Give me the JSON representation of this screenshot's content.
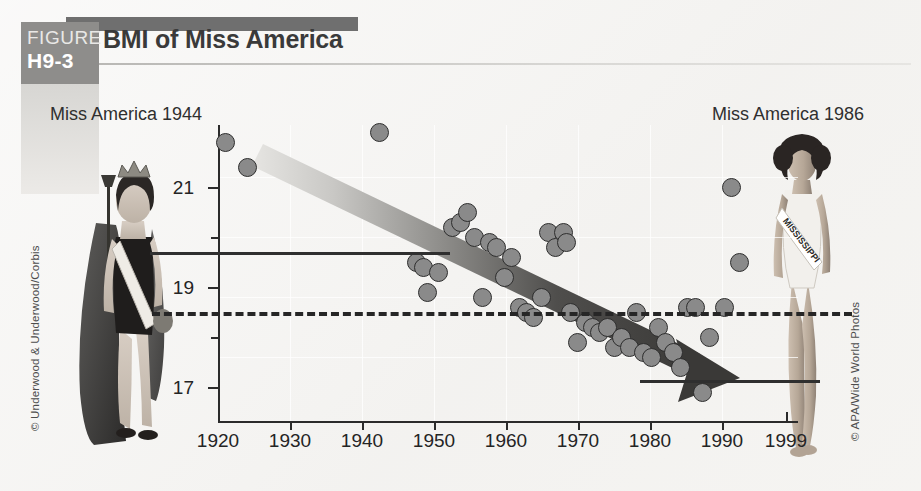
{
  "figure": {
    "badge_word": "FIGURE",
    "badge_number": "H9-3",
    "title": "BMI of Miss America"
  },
  "credits": {
    "left": "© Underwood & Underwood/Corbis",
    "right": "© APA/Wide World Photos"
  },
  "photos": {
    "left_caption": "Miss America 1944",
    "right_caption": "Miss America 1986",
    "right_sash_text": "MISSISSIPPI"
  },
  "colors": {
    "badge_gray": "#8e8d8b",
    "header_bar_gray": "#6f6f6f",
    "dot_fill": "#8a8a8a",
    "dot_stroke": "#2e2e2e",
    "axis": "#2b2b2b",
    "arrow_dark": "#3a3a3a",
    "page_bg": "#f4f3f1"
  },
  "chart_data": {
    "type": "scatter",
    "title": "BMI of Miss America",
    "xlabel": "",
    "ylabel": "",
    "xlim": [
      1920,
      1999
    ],
    "ylim": [
      16.2,
      22.2
    ],
    "grid": true,
    "legend": "none",
    "x_ticks": [
      1920,
      1930,
      1940,
      1950,
      1960,
      1970,
      1980,
      1990,
      1999
    ],
    "x_tick_labels": [
      "1920",
      "1930",
      "1940",
      "1950",
      "1960",
      "1970",
      "1980",
      "1990",
      "1999"
    ],
    "y_ticks_major": [
      17,
      19,
      21
    ],
    "y_tick_labels": [
      "17",
      "19",
      "21"
    ],
    "y_ticks_minor": [
      18,
      20
    ],
    "points": [
      {
        "year": 1921,
        "bmi": 21.9
      },
      {
        "year": 1924,
        "bmi": 21.4
      },
      {
        "year": 1942,
        "bmi": 22.1
      },
      {
        "year": 1947,
        "bmi": 19.5
      },
      {
        "year": 1948,
        "bmi": 19.4
      },
      {
        "year": 1948.5,
        "bmi": 18.9
      },
      {
        "year": 1950,
        "bmi": 19.3
      },
      {
        "year": 1952,
        "bmi": 20.2
      },
      {
        "year": 1953,
        "bmi": 20.3
      },
      {
        "year": 1954,
        "bmi": 20.5
      },
      {
        "year": 1955,
        "bmi": 20.0
      },
      {
        "year": 1956,
        "bmi": 18.8
      },
      {
        "year": 1957,
        "bmi": 19.9
      },
      {
        "year": 1958,
        "bmi": 19.8
      },
      {
        "year": 1959,
        "bmi": 19.2
      },
      {
        "year": 1960,
        "bmi": 19.6
      },
      {
        "year": 1961,
        "bmi": 18.6
      },
      {
        "year": 1962,
        "bmi": 18.5
      },
      {
        "year": 1963,
        "bmi": 18.4
      },
      {
        "year": 1964,
        "bmi": 18.8
      },
      {
        "year": 1965,
        "bmi": 20.1
      },
      {
        "year": 1966,
        "bmi": 19.8
      },
      {
        "year": 1967,
        "bmi": 20.1
      },
      {
        "year": 1967.5,
        "bmi": 19.9
      },
      {
        "year": 1968,
        "bmi": 18.5
      },
      {
        "year": 1969,
        "bmi": 17.9
      },
      {
        "year": 1970,
        "bmi": 18.3
      },
      {
        "year": 1971,
        "bmi": 18.2
      },
      {
        "year": 1972,
        "bmi": 18.1
      },
      {
        "year": 1973,
        "bmi": 18.2
      },
      {
        "year": 1974,
        "bmi": 17.8
      },
      {
        "year": 1975,
        "bmi": 18.0
      },
      {
        "year": 1976,
        "bmi": 17.8
      },
      {
        "year": 1977,
        "bmi": 18.5
      },
      {
        "year": 1978,
        "bmi": 17.7
      },
      {
        "year": 1979,
        "bmi": 17.6
      },
      {
        "year": 1980,
        "bmi": 18.2
      },
      {
        "year": 1981,
        "bmi": 17.9
      },
      {
        "year": 1982,
        "bmi": 17.7
      },
      {
        "year": 1983,
        "bmi": 17.4
      },
      {
        "year": 1984,
        "bmi": 18.6
      },
      {
        "year": 1985,
        "bmi": 18.6
      },
      {
        "year": 1986,
        "bmi": 16.9
      },
      {
        "year": 1987,
        "bmi": 18.0
      },
      {
        "year": 1989,
        "bmi": 18.6
      },
      {
        "year": 1990,
        "bmi": 21.0
      },
      {
        "year": 1991,
        "bmi": 19.5
      }
    ],
    "annotations": [
      {
        "name": "trend-arrow",
        "type": "arrow",
        "from": {
          "year": 1928,
          "bmi": 21.7
        },
        "to": {
          "year": 1993,
          "bmi": 17.0
        },
        "note": "downward trend"
      },
      {
        "name": "reference-line-1944",
        "type": "hline-solid",
        "bmi": 19.6,
        "from_year": 1920,
        "to_year": 1948,
        "note": "BMI of Miss America 1944"
      },
      {
        "name": "reference-line-1986",
        "type": "hline-solid",
        "bmi": 16.9,
        "from_year": 1986,
        "to_year": 1999,
        "note": "BMI of Miss America 1986"
      },
      {
        "name": "underweight-threshold",
        "type": "hline-dashed",
        "bmi": 18.5,
        "from_year": 1920,
        "to_year": 1999
      }
    ]
  }
}
